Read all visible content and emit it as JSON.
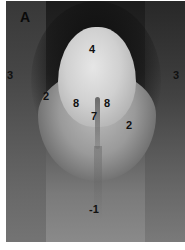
{
  "figure": {
    "panel_label": "A",
    "image_type": "grayscale micrograph",
    "labels": [
      {
        "id": "label-4",
        "text": "4",
        "x": 89,
        "y": 44
      },
      {
        "id": "label-3-left",
        "text": "3",
        "x": 7,
        "y": 70
      },
      {
        "id": "label-3-right",
        "text": "3",
        "x": 173,
        "y": 70
      },
      {
        "id": "label-2-left",
        "text": "2",
        "x": 43,
        "y": 91
      },
      {
        "id": "label-8-left",
        "text": "8",
        "x": 73,
        "y": 98
      },
      {
        "id": "label-8-right",
        "text": "8",
        "x": 104,
        "y": 98
      },
      {
        "id": "label-7",
        "text": "7",
        "x": 91,
        "y": 111
      },
      {
        "id": "label-2-right",
        "text": "2",
        "x": 126,
        "y": 120
      },
      {
        "id": "label-1",
        "text": "-1",
        "x": 89,
        "y": 204
      }
    ]
  }
}
